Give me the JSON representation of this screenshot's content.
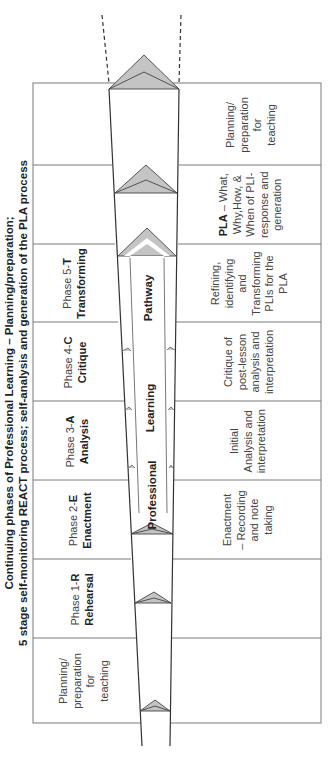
{
  "title": {
    "line1": "Continuing phases of Professional Learning – Planning/preparation;",
    "line2": "5 stage self-monitoring REACT process; self-analysis and generation of the PLA process"
  },
  "funnel": {
    "arrow_labels": [
      "Professional",
      "Learning",
      "Pathway"
    ]
  },
  "rows": [
    {
      "left_lines": [],
      "left_bold": "",
      "right_bold": "",
      "right_lines": [
        "Planning/",
        "preparation",
        "for",
        "teaching"
      ]
    },
    {
      "left_lines": [],
      "left_bold": "",
      "right_bold": "PLA",
      "right_lines": [
        " – What,",
        "Why,How, &",
        "When of PLI-",
        "response and",
        "generation"
      ]
    },
    {
      "left_lines": [
        "Phase 5-"
      ],
      "left_bold": "T",
      "left_line2": "Transforming",
      "right_bold": "",
      "right_lines": [
        "Refining,",
        "identifying",
        "and",
        "Transforming",
        "PLIs for the",
        "PLA"
      ]
    },
    {
      "left_lines": [
        "Phase 4-"
      ],
      "left_bold": "C",
      "left_line2": "Critique",
      "right_bold": "",
      "right_lines": [
        "Critique of",
        "post-lesson",
        "analysis and",
        "interpretation"
      ]
    },
    {
      "left_lines": [
        "Phase 3-"
      ],
      "left_bold": "A",
      "left_line2": "Analysis",
      "right_bold": "",
      "right_lines": [
        "Initial",
        "Analysis and",
        "interpretation"
      ]
    },
    {
      "left_lines": [
        "Phase 2-"
      ],
      "left_bold": "E",
      "left_line2": "Enactment",
      "right_bold": "",
      "right_lines": [
        "Enactment",
        "– Recording",
        "and note",
        "taking"
      ]
    },
    {
      "left_lines": [
        "Phase 1-"
      ],
      "left_bold": "R",
      "left_line2": "Rehearsal",
      "right_bold": "",
      "right_lines": []
    },
    {
      "left_lines": [
        "Planning/",
        "preparation",
        "for",
        "teaching"
      ],
      "left_bold": "",
      "right_bold": "",
      "right_lines": []
    }
  ],
  "labels": {
    "row0_right": [
      "Planning/",
      "preparation",
      "for",
      "teaching"
    ],
    "row1_right_bold": "PLA",
    "row1_right_rest1": " – What,",
    "row1_right_rest": [
      "Why,How, &",
      "When of PLI-",
      "response and",
      "generation"
    ],
    "row2_left_a": "Phase 5-",
    "row2_left_b": "T",
    "row2_left_c": "Transforming",
    "row2_right": [
      "Refining,",
      "identifying",
      "and",
      "Transforming",
      "PLIs for the",
      "PLA"
    ],
    "row3_left_a": "Phase 4-",
    "row3_left_b": "C",
    "row3_left_c": "Critique",
    "row3_right": [
      "Critique of",
      "post-lesson",
      "analysis and",
      "interpretation"
    ],
    "row4_left_a": "Phase 3-",
    "row4_left_b": "A",
    "row4_left_c": "Analysis",
    "row4_right": [
      "Initial",
      "Analysis and",
      "interpretation"
    ],
    "row5_left_a": "Phase 2-",
    "row5_left_b": "E",
    "row5_left_c": "Enactment",
    "row5_right": [
      "Enactment",
      "– Recording",
      "and note",
      "taking"
    ],
    "row6_left_a": "Phase 1-",
    "row6_left_b": "R",
    "row6_left_c": "Rehearsal",
    "row7_left": [
      "Planning/",
      "preparation",
      "for",
      "teaching"
    ]
  },
  "colors": {
    "line": "#3a3a3a",
    "table_border": "#777777",
    "triangle_fill": "#c4c4c4",
    "background": "#ffffff"
  }
}
